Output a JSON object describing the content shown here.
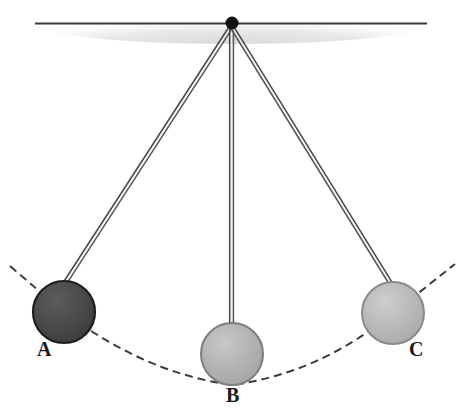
{
  "figure": {
    "width": 464,
    "height": 419,
    "background_color": "#ffffff"
  },
  "ceiling": {
    "name": "ceiling-support",
    "line_color": "#3a3a3a",
    "shade_color": "#e2e2e2",
    "line_y": 23,
    "line_x_start": 35,
    "line_x_end": 427
  },
  "pivot": {
    "name": "pivot-point",
    "x": 232,
    "y": 23,
    "radius": 6,
    "color": "#111111"
  },
  "arc": {
    "name": "swing-arc",
    "style": "dashed",
    "color": "#3c3c3c",
    "dash": "8 5",
    "width": 2
  },
  "rods": {
    "color": "#4a4a4a",
    "width": 1.4,
    "gap": 3
  },
  "bobs": [
    {
      "id": "A",
      "label": "A",
      "name": "pendulum-bob-a",
      "cx": 64,
      "cy": 312,
      "r": 31,
      "fill": "#4a4a4a",
      "fill_light": "#5e5e5e",
      "stroke": "#1e1e1e",
      "position": "left extreme"
    },
    {
      "id": "B",
      "label": "B",
      "name": "pendulum-bob-b",
      "cx": 232,
      "cy": 354,
      "r": 31,
      "fill": "#b0b0b0",
      "fill_light": "#c6c6c6",
      "stroke": "#7d7d7d",
      "position": "lowest point"
    },
    {
      "id": "C",
      "label": "C",
      "name": "pendulum-bob-c",
      "cx": 393,
      "cy": 313,
      "r": 31,
      "fill": "#b6b6b6",
      "fill_light": "#cccccc",
      "stroke": "#868686",
      "position": "right extreme"
    }
  ]
}
